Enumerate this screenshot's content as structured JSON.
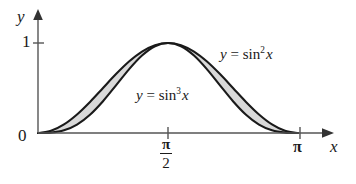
{
  "figure": {
    "background_color": "#ffffff",
    "ink_color": "#1a1a1a",
    "shade_color": "#d9d9d9",
    "axes": {
      "y_axis_label": "y",
      "x_axis_label": "x",
      "origin_label": "0",
      "y_ticks": [
        {
          "value": 1,
          "label": "1"
        }
      ],
      "x_ticks": [
        {
          "value": 1.5708,
          "label_numerator": "π",
          "label_denominator": "2"
        },
        {
          "value": 3.1416,
          "label": "π"
        }
      ]
    },
    "curve_labels": {
      "upper": {
        "lhs": "y",
        "eq": " = ",
        "fn": "sin",
        "power": "2",
        "arg": "x"
      },
      "lower": {
        "lhs": "y",
        "eq": " = ",
        "fn": "sin",
        "power": "3",
        "arg": "x"
      }
    }
  },
  "chart_data": {
    "type": "line",
    "title": "",
    "xlabel": "x",
    "ylabel": "y",
    "xlim": [
      0,
      3.1416
    ],
    "ylim": [
      0,
      1.12
    ],
    "grid": false,
    "legend_position": "inline-annotation",
    "xtick_values": [
      1.5708,
      3.1416
    ],
    "xtick_labels": [
      "π/2",
      "π"
    ],
    "ytick_values": [
      1
    ],
    "ytick_labels": [
      "1"
    ],
    "shaded_region": {
      "between": [
        "y = sin^2 x",
        "y = sin^3 x"
      ],
      "from_x": 0,
      "to_x": 3.1416,
      "fill": "#d9d9d9"
    },
    "x": [
      0.0,
      0.1571,
      0.3142,
      0.4712,
      0.6283,
      0.7854,
      0.9425,
      1.0996,
      1.2566,
      1.4137,
      1.5708,
      1.7279,
      1.885,
      2.042,
      2.1991,
      2.3562,
      2.5133,
      2.6704,
      2.8274,
      2.9845,
      3.1416
    ],
    "series": [
      {
        "name": "y = sin^2 x",
        "label": "y = sin² x",
        "values": [
          0.0,
          0.0245,
          0.0955,
          0.2061,
          0.3455,
          0.5,
          0.6545,
          0.7939,
          0.9045,
          0.9755,
          1.0,
          0.9755,
          0.9045,
          0.7939,
          0.6545,
          0.5,
          0.3455,
          0.2061,
          0.0955,
          0.0245,
          0.0
        ]
      },
      {
        "name": "y = sin^3 x",
        "label": "y = sin³ x",
        "values": [
          0.0,
          0.0038,
          0.0295,
          0.0935,
          0.2031,
          0.3536,
          0.5295,
          0.7073,
          0.8602,
          0.9639,
          1.0,
          0.9639,
          0.8602,
          0.7073,
          0.5295,
          0.3536,
          0.2031,
          0.0935,
          0.0295,
          0.0038,
          0.0
        ]
      }
    ],
    "annotations": [
      {
        "text": "y = sin² x",
        "near_x": 2.45,
        "near_y": 0.88
      },
      {
        "text": "y = sin³ x",
        "near_x": 1.55,
        "near_y": 0.47
      }
    ]
  }
}
